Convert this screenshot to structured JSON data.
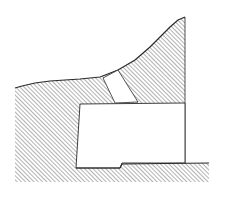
{
  "diagram": {
    "type": "cross-section",
    "colors": {
      "background": "#ffffff",
      "ink": "#2a2a2a",
      "hatch": "#555555"
    },
    "elements": [
      {
        "name": "rock-mass",
        "kind": "hatched-region"
      },
      {
        "name": "shaft",
        "kind": "open-passage"
      },
      {
        "name": "chamber",
        "kind": "open-room"
      },
      {
        "name": "floor-step",
        "kind": "ledge"
      }
    ]
  }
}
